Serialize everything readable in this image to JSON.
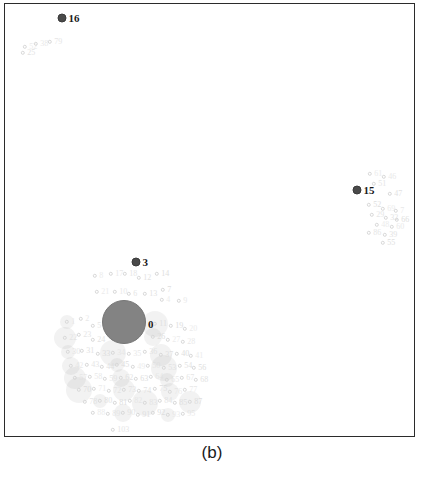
{
  "caption": "(b)",
  "colors": {
    "frame": "#2b2b2b",
    "major_marker": "#4a4a4a",
    "huge_marker": "#7d7d7d",
    "faint_marker": "#d8d8d8",
    "major_label": "#1a1a1a",
    "faint_label": "#dcdcdc",
    "background": "#ffffff"
  },
  "chart_data": {
    "type": "scatter",
    "title": "",
    "subtitle": "",
    "xlabel": "",
    "ylabel": "",
    "xlim": [
      0,
      411
    ],
    "ylim": [
      0,
      434
    ],
    "grid": false,
    "legend": false,
    "axis_ticks": false,
    "series": [
      {
        "name": "major-clusters",
        "style": "dark filled circle with bold numeric label",
        "points": [
          {
            "label": "16",
            "x": 57,
            "y": 14,
            "r": 4.5
          },
          {
            "label": "15",
            "x": 352,
            "y": 186,
            "r": 4.5
          },
          {
            "label": "3",
            "x": 131,
            "y": 258,
            "r": 4.5
          },
          {
            "label": "0",
            "x": 119,
            "y": 318,
            "r": 22
          }
        ]
      },
      {
        "name": "faint-points-topleft",
        "style": "light gray open circle with small numeric label",
        "points": [
          {
            "label": "52",
            "x": 20,
            "y": 43,
            "r": 2.2
          },
          {
            "label": "38",
            "x": 31,
            "y": 40,
            "r": 2.2
          },
          {
            "label": "79",
            "x": 45,
            "y": 38,
            "r": 2.2
          },
          {
            "label": "25",
            "x": 18,
            "y": 49,
            "r": 2.2
          }
        ]
      },
      {
        "name": "faint-points-right",
        "style": "light gray open circle with small numeric label",
        "points": [
          {
            "label": "61",
            "x": 365,
            "y": 170,
            "r": 2.2
          },
          {
            "label": "46",
            "x": 379,
            "y": 173,
            "r": 2.2
          },
          {
            "label": "51",
            "x": 369,
            "y": 180,
            "r": 2.2
          },
          {
            "label": "47",
            "x": 385,
            "y": 190,
            "r": 2.2
          },
          {
            "label": "52",
            "x": 364,
            "y": 201,
            "r": 2.2
          },
          {
            "label": "69",
            "x": 378,
            "y": 205,
            "r": 2.2
          },
          {
            "label": "7",
            "x": 391,
            "y": 207,
            "r": 2.2
          },
          {
            "label": "29",
            "x": 367,
            "y": 211,
            "r": 2.2
          },
          {
            "label": "32",
            "x": 381,
            "y": 214,
            "r": 2.2
          },
          {
            "label": "66",
            "x": 392,
            "y": 216,
            "r": 2.2
          },
          {
            "label": "48",
            "x": 372,
            "y": 221,
            "r": 2.2
          },
          {
            "label": "60",
            "x": 387,
            "y": 223,
            "r": 2.2
          },
          {
            "label": "86",
            "x": 364,
            "y": 229,
            "r": 2.2
          },
          {
            "label": "39",
            "x": 380,
            "y": 231,
            "r": 2.2
          },
          {
            "label": "55",
            "x": 378,
            "y": 239,
            "r": 2.2
          }
        ]
      },
      {
        "name": "faint-points-center-upper",
        "style": "light gray open circle with small numeric label",
        "points": [
          {
            "label": "8",
            "x": 90,
            "y": 272,
            "r": 2.2
          },
          {
            "label": "17",
            "x": 106,
            "y": 270,
            "r": 2.2
          },
          {
            "label": "18",
            "x": 120,
            "y": 270,
            "r": 2.2
          },
          {
            "label": "12",
            "x": 134,
            "y": 274,
            "r": 2.2
          },
          {
            "label": "14",
            "x": 152,
            "y": 270,
            "r": 2.2
          },
          {
            "label": "21",
            "x": 92,
            "y": 288,
            "r": 2.2
          },
          {
            "label": "10",
            "x": 110,
            "y": 288,
            "r": 2.2
          },
          {
            "label": "6",
            "x": 124,
            "y": 290,
            "r": 2.2
          },
          {
            "label": "13",
            "x": 140,
            "y": 290,
            "r": 2.2
          },
          {
            "label": "7",
            "x": 158,
            "y": 286,
            "r": 2.2
          },
          {
            "label": "4",
            "x": 157,
            "y": 296,
            "r": 2.2
          },
          {
            "label": "9",
            "x": 174,
            "y": 297,
            "r": 2.2
          }
        ]
      },
      {
        "name": "faint-points-bottom-cloud",
        "style": "light gray open circle with small numeric label, dense overlapping cloud",
        "points": [
          {
            "label": "1",
            "x": 62,
            "y": 318,
            "r": 2.2
          },
          {
            "label": "2",
            "x": 76,
            "y": 315,
            "r": 2.2
          },
          {
            "label": "5",
            "x": 88,
            "y": 322,
            "r": 2.2
          },
          {
            "label": "11",
            "x": 150,
            "y": 320,
            "r": 2.2
          },
          {
            "label": "19",
            "x": 166,
            "y": 322,
            "r": 2.2
          },
          {
            "label": "20",
            "x": 180,
            "y": 325,
            "r": 2.2
          },
          {
            "label": "22",
            "x": 60,
            "y": 334,
            "r": 2.2
          },
          {
            "label": "23",
            "x": 74,
            "y": 331,
            "r": 2.2
          },
          {
            "label": "24",
            "x": 88,
            "y": 336,
            "r": 2.2
          },
          {
            "label": "26",
            "x": 148,
            "y": 333,
            "r": 2.2
          },
          {
            "label": "27",
            "x": 163,
            "y": 336,
            "r": 2.2
          },
          {
            "label": "28",
            "x": 178,
            "y": 338,
            "r": 2.2
          },
          {
            "label": "30",
            "x": 63,
            "y": 348,
            "r": 2.2
          },
          {
            "label": "31",
            "x": 77,
            "y": 347,
            "r": 2.2
          },
          {
            "label": "33",
            "x": 93,
            "y": 350,
            "r": 2.2
          },
          {
            "label": "34",
            "x": 108,
            "y": 349,
            "r": 2.2
          },
          {
            "label": "35",
            "x": 124,
            "y": 350,
            "r": 2.2
          },
          {
            "label": "36",
            "x": 140,
            "y": 348,
            "r": 2.2
          },
          {
            "label": "37",
            "x": 156,
            "y": 351,
            "r": 2.2
          },
          {
            "label": "40",
            "x": 172,
            "y": 350,
            "r": 2.2
          },
          {
            "label": "41",
            "x": 186,
            "y": 352,
            "r": 2.2
          },
          {
            "label": "42",
            "x": 66,
            "y": 362,
            "r": 2.2
          },
          {
            "label": "43",
            "x": 82,
            "y": 361,
            "r": 2.2
          },
          {
            "label": "44",
            "x": 97,
            "y": 363,
            "r": 2.2
          },
          {
            "label": "45",
            "x": 112,
            "y": 361,
            "r": 2.2
          },
          {
            "label": "49",
            "x": 128,
            "y": 363,
            "r": 2.2
          },
          {
            "label": "50",
            "x": 143,
            "y": 362,
            "r": 2.2
          },
          {
            "label": "53",
            "x": 159,
            "y": 364,
            "r": 2.2
          },
          {
            "label": "54",
            "x": 175,
            "y": 362,
            "r": 2.2
          },
          {
            "label": "56",
            "x": 189,
            "y": 364,
            "r": 2.2
          },
          {
            "label": "57",
            "x": 70,
            "y": 374,
            "r": 2.2
          },
          {
            "label": "58",
            "x": 85,
            "y": 373,
            "r": 2.2
          },
          {
            "label": "59",
            "x": 100,
            "y": 375,
            "r": 2.2
          },
          {
            "label": "62",
            "x": 116,
            "y": 374,
            "r": 2.2
          },
          {
            "label": "63",
            "x": 131,
            "y": 375,
            "r": 2.2
          },
          {
            "label": "64",
            "x": 146,
            "y": 373,
            "r": 2.2
          },
          {
            "label": "65",
            "x": 162,
            "y": 376,
            "r": 2.2
          },
          {
            "label": "67",
            "x": 177,
            "y": 374,
            "r": 2.2
          },
          {
            "label": "68",
            "x": 191,
            "y": 376,
            "r": 2.2
          },
          {
            "label": "70",
            "x": 74,
            "y": 386,
            "r": 2.2
          },
          {
            "label": "71",
            "x": 89,
            "y": 385,
            "r": 2.2
          },
          {
            "label": "72",
            "x": 104,
            "y": 387,
            "r": 2.2
          },
          {
            "label": "73",
            "x": 119,
            "y": 386,
            "r": 2.2
          },
          {
            "label": "74",
            "x": 134,
            "y": 387,
            "r": 2.2
          },
          {
            "label": "75",
            "x": 150,
            "y": 385,
            "r": 2.2
          },
          {
            "label": "76",
            "x": 165,
            "y": 388,
            "r": 2.2
          },
          {
            "label": "77",
            "x": 180,
            "y": 386,
            "r": 2.2
          },
          {
            "label": "78",
            "x": 80,
            "y": 398,
            "r": 2.2
          },
          {
            "label": "80",
            "x": 95,
            "y": 397,
            "r": 2.2
          },
          {
            "label": "81",
            "x": 110,
            "y": 399,
            "r": 2.2
          },
          {
            "label": "82",
            "x": 125,
            "y": 397,
            "r": 2.2
          },
          {
            "label": "83",
            "x": 140,
            "y": 399,
            "r": 2.2
          },
          {
            "label": "84",
            "x": 155,
            "y": 397,
            "r": 2.2
          },
          {
            "label": "85",
            "x": 170,
            "y": 399,
            "r": 2.2
          },
          {
            "label": "87",
            "x": 185,
            "y": 398,
            "r": 2.2
          },
          {
            "label": "88",
            "x": 88,
            "y": 409,
            "r": 2.2
          },
          {
            "label": "89",
            "x": 103,
            "y": 410,
            "r": 2.2
          },
          {
            "label": "90",
            "x": 118,
            "y": 409,
            "r": 2.2
          },
          {
            "label": "91",
            "x": 133,
            "y": 411,
            "r": 2.2
          },
          {
            "label": "92",
            "x": 148,
            "y": 409,
            "r": 2.2
          },
          {
            "label": "93",
            "x": 163,
            "y": 411,
            "r": 2.2
          },
          {
            "label": "95",
            "x": 178,
            "y": 410,
            "r": 2.2
          },
          {
            "label": "103",
            "x": 108,
            "y": 426,
            "r": 2.2
          }
        ]
      }
    ]
  }
}
